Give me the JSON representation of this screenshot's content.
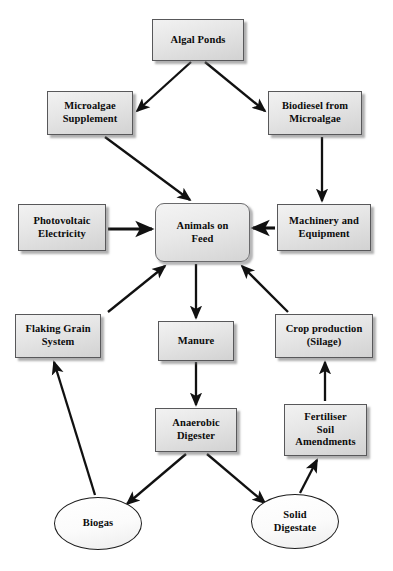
{
  "diagram": {
    "type": "flow-diagram",
    "background_color": "#ffffff",
    "edge_color": "#111111",
    "box_fill_color": "#e8e8e8",
    "box_border_color": "#58585a",
    "ellipse_fill_color": "#ffffff",
    "ellipse_border_color": "#1d1d1d",
    "nodes": [
      {
        "id": "algal-ponds",
        "label": "Algal Ponds",
        "shape": "rectangle",
        "x": 152,
        "y": 19,
        "w": 92,
        "h": 42
      },
      {
        "id": "microalgae-supplement",
        "label": "Microalgae\nSupplement",
        "shape": "rectangle",
        "x": 47,
        "y": 91,
        "w": 86,
        "h": 44
      },
      {
        "id": "biodiesel-from-microalgae",
        "label": "Biodiesel from\nMicroalgae",
        "shape": "rectangle",
        "x": 268,
        "y": 91,
        "w": 94,
        "h": 44
      },
      {
        "id": "animals-on-feed",
        "label": "Animals on\nFeed",
        "shape": "rounded-rectangle",
        "x": 155,
        "y": 203,
        "w": 95,
        "h": 59
      },
      {
        "id": "photovoltaic-electricity",
        "label": "Photovoltaic\nElectricity",
        "shape": "rectangle",
        "x": 18,
        "y": 204,
        "w": 88,
        "h": 47
      },
      {
        "id": "machinery-and-equipment",
        "label": "Machinery and\nEquipment",
        "shape": "rectangle",
        "x": 277,
        "y": 204,
        "w": 94,
        "h": 47
      },
      {
        "id": "flaking-grain-system",
        "label": "Flaking Grain\nSystem",
        "shape": "rectangle",
        "x": 15,
        "y": 314,
        "w": 86,
        "h": 44
      },
      {
        "id": "manure",
        "label": "Manure",
        "shape": "rectangle",
        "x": 158,
        "y": 321,
        "w": 76,
        "h": 40
      },
      {
        "id": "crop-production-silage",
        "label": "Crop production\n(Silage)",
        "shape": "rectangle",
        "x": 275,
        "y": 314,
        "w": 98,
        "h": 44
      },
      {
        "id": "anaerobic-digester",
        "label": "Anaerobic\nDigester",
        "shape": "rectangle",
        "x": 155,
        "y": 408,
        "w": 82,
        "h": 44
      },
      {
        "id": "fertiliser-soil-amendments",
        "label": "Fertiliser\nSoil\nAmendments",
        "shape": "rectangle",
        "x": 284,
        "y": 404,
        "w": 83,
        "h": 52
      },
      {
        "id": "biogas",
        "label": "Biogas",
        "shape": "ellipse",
        "x": 54,
        "y": 497,
        "w": 88,
        "h": 53
      },
      {
        "id": "solid-digestate",
        "label": "Solid\nDigestate",
        "shape": "ellipse",
        "x": 251,
        "y": 494,
        "w": 88,
        "h": 55
      }
    ],
    "edges": [
      {
        "id": "edge-algal-ponds-to-microalgae-supplement",
        "from": "algal-ponds",
        "to": "microalgae-supplement",
        "x1": 191,
        "y1": 62,
        "x2": 137,
        "y2": 111
      },
      {
        "id": "edge-algal-ponds-to-biodiesel",
        "from": "algal-ponds",
        "to": "biodiesel-from-microalgae",
        "x1": 205,
        "y1": 62,
        "x2": 265,
        "y2": 111
      },
      {
        "id": "edge-microalgae-supplement-to-animals",
        "from": "microalgae-supplement",
        "to": "animals-on-feed",
        "x1": 105,
        "y1": 137,
        "x2": 190,
        "y2": 200
      },
      {
        "id": "edge-biodiesel-to-machinery",
        "from": "biodiesel-from-microalgae",
        "to": "machinery-and-equipment",
        "x1": 322,
        "y1": 137,
        "x2": 322,
        "y2": 201
      },
      {
        "id": "edge-photovoltaic-to-animals",
        "from": "photovoltaic-electricity",
        "to": "animals-on-feed",
        "x1": 108,
        "y1": 229,
        "x2": 152,
        "y2": 229
      },
      {
        "id": "edge-machinery-to-animals",
        "from": "machinery-and-equipment",
        "to": "animals-on-feed",
        "x1": 275,
        "y1": 228,
        "x2": 253,
        "y2": 228
      },
      {
        "id": "edge-animals-to-manure",
        "from": "animals-on-feed",
        "to": "manure",
        "x1": 196,
        "y1": 264,
        "x2": 196,
        "y2": 318
      },
      {
        "id": "edge-flaking-grain-to-animals",
        "from": "flaking-grain-system",
        "to": "animals-on-feed",
        "x1": 108,
        "y1": 312,
        "x2": 165,
        "y2": 266
      },
      {
        "id": "edge-crop-production-to-animals",
        "from": "crop-production-silage",
        "to": "animals-on-feed",
        "x1": 288,
        "y1": 312,
        "x2": 242,
        "y2": 266
      },
      {
        "id": "edge-manure-to-anaerobic-digester",
        "from": "manure",
        "to": "anaerobic-digester",
        "x1": 196,
        "y1": 362,
        "x2": 196,
        "y2": 405
      },
      {
        "id": "edge-anaerobic-digester-to-biogas",
        "from": "anaerobic-digester",
        "to": "biogas",
        "x1": 186,
        "y1": 454,
        "x2": 127,
        "y2": 504
      },
      {
        "id": "edge-anaerobic-digester-to-solid-digestate",
        "from": "anaerobic-digester",
        "to": "solid-digestate",
        "x1": 207,
        "y1": 454,
        "x2": 265,
        "y2": 503
      },
      {
        "id": "edge-biogas-to-flaking-grain",
        "from": "biogas",
        "to": "flaking-grain-system",
        "x1": 95,
        "y1": 495,
        "x2": 54,
        "y2": 362
      },
      {
        "id": "edge-solid-digestate-to-fertiliser",
        "from": "solid-digestate",
        "to": "fertiliser-soil-amendments",
        "x1": 300,
        "y1": 493,
        "x2": 317,
        "y2": 460
      },
      {
        "id": "edge-fertiliser-to-crop-production",
        "from": "fertiliser-soil-amendments",
        "to": "crop-production-silage",
        "x1": 325,
        "y1": 401,
        "x2": 325,
        "y2": 362
      }
    ]
  }
}
